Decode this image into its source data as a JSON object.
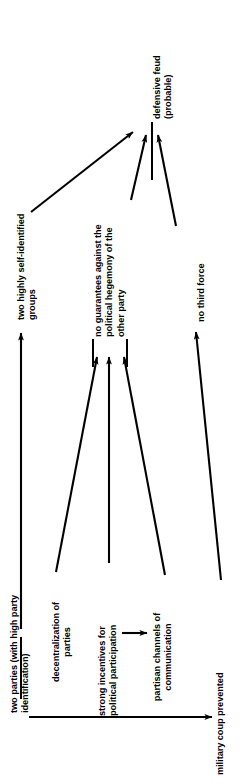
{
  "diagram": {
    "orientation": "rotated-90-ccw",
    "background_color": "#ffffff",
    "ink_color": "#000000",
    "nodes": [
      {
        "id": "two-parties",
        "label": "two parties (with high party identification)",
        "lines": [
          "two parties (with high party",
          "identification)"
        ],
        "has_underline": true
      },
      {
        "id": "decentralization",
        "label": "decentralization of parties",
        "lines": [
          "decentralization of",
          "parties"
        ],
        "has_underline": false
      },
      {
        "id": "strong-incentives",
        "label": "strong incentives for political participation",
        "lines": [
          "strong incentives for",
          "political participation"
        ],
        "has_underline": false
      },
      {
        "id": "partisan-channels",
        "label": "partisan channels of communication",
        "lines": [
          "partisan channels of",
          "communication"
        ],
        "has_underline": false
      },
      {
        "id": "military-coup",
        "label": "military coup prevented",
        "lines": [
          "military coup prevented"
        ],
        "has_underline": false
      },
      {
        "id": "two-highly-self-identified-groups",
        "label": "two highly self-identified groups",
        "lines": [
          "two highly self-identified",
          "groups"
        ],
        "has_underline": false
      },
      {
        "id": "no-guarantees",
        "label": "no guarantees against the political hegemony of the other party",
        "lines": [
          "no guarantees against the",
          "political hegemony of the",
          "other party"
        ],
        "has_underline": true
      },
      {
        "id": "no-third-force",
        "label": "no third force",
        "lines": [
          "no third force"
        ],
        "has_underline": false
      },
      {
        "id": "defensive-feud",
        "label": "defensive feud (probable)",
        "lines": [
          "defensive feud",
          "(probable)"
        ],
        "has_underline": true
      }
    ],
    "edges": [
      {
        "id": "edge-two-parties-to-groups",
        "from": "two parties (with high party identification)",
        "to": "two highly self-identified groups"
      },
      {
        "id": "edge-two-parties-to-military-coup",
        "from": "two parties (with high party identification)",
        "to": "military coup prevented"
      },
      {
        "id": "edge-decentralization-to-no-guarantees",
        "from": "decentralization of parties",
        "to": "no guarantees against the political hegemony of the other party"
      },
      {
        "id": "edge-strong-incentives-to-no-guarantees",
        "from": "strong incentives for political participation",
        "to": "no guarantees against the political hegemony of the other party"
      },
      {
        "id": "edge-strong-incentives-to-partisan-channels",
        "from": "strong incentives for political participation",
        "to": "partisan channels of communication"
      },
      {
        "id": "edge-partisan-channels-to-no-guarantees",
        "from": "partisan channels of communication",
        "to": "no guarantees against the political hegemony of the other party"
      },
      {
        "id": "edge-military-coup-to-no-third-force",
        "from": "military coup prevented",
        "to": "no third force"
      },
      {
        "id": "edge-groups-to-defensive-feud",
        "from": "two highly self-identified groups",
        "to": "defensive feud (probable)"
      },
      {
        "id": "edge-no-guarantees-to-defensive-feud",
        "from": "no guarantees against the political hegemony of the other party",
        "to": "defensive feud (probable)"
      },
      {
        "id": "edge-no-third-force-to-defensive-feud",
        "from": "no third force",
        "to": "defensive feud (probable)"
      }
    ]
  }
}
